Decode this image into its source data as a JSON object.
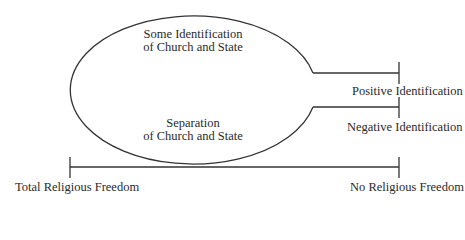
{
  "diagram": {
    "ellipse": {
      "top_label_line1": "Some Identification",
      "top_label_line2": "of Church and State",
      "bottom_label_line1": "Separation",
      "bottom_label_line2": "of Church and State"
    },
    "branches": {
      "positive": "Positive Identification",
      "negative": "Negative Identification"
    },
    "axis": {
      "left_label": "Total Religious Freedom",
      "right_label": "No Religious Freedom"
    },
    "colors": {
      "line": "#333333",
      "text": "#2a2a2a",
      "background": "#ffffff"
    }
  }
}
